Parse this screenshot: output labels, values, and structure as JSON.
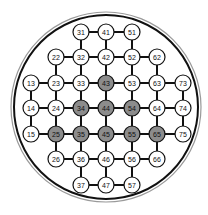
{
  "diagram": {
    "type": "grid-node-map",
    "colors": {
      "background": "#ffffff",
      "line": "#111111",
      "node_fill": "#ffffff",
      "node_highlight_fill": "#8c8c8c",
      "node_stroke": "#111111",
      "outer_ring_dark": "#111111",
      "outer_ring_light": "#9a9a9a"
    },
    "outer_circle": {
      "cx": 106,
      "cy": 107,
      "r_outer": 95,
      "r_inner": 92
    },
    "grid": {
      "columns_x": [
        31,
        56,
        81,
        106,
        132,
        157,
        183
      ],
      "rows_y": [
        32,
        57,
        83,
        108,
        134,
        159,
        185
      ],
      "node_radius": 8
    },
    "nodes": [
      {
        "label": "13",
        "col": 1,
        "row": 3,
        "highlighted": false
      },
      {
        "label": "14",
        "col": 1,
        "row": 4,
        "highlighted": false
      },
      {
        "label": "15",
        "col": 1,
        "row": 5,
        "highlighted": false
      },
      {
        "label": "22",
        "col": 2,
        "row": 2,
        "highlighted": false
      },
      {
        "label": "23",
        "col": 2,
        "row": 3,
        "highlighted": false
      },
      {
        "label": "24",
        "col": 2,
        "row": 4,
        "highlighted": false
      },
      {
        "label": "25",
        "col": 2,
        "row": 5,
        "highlighted": true
      },
      {
        "label": "26",
        "col": 2,
        "row": 6,
        "highlighted": false
      },
      {
        "label": "31",
        "col": 3,
        "row": 1,
        "highlighted": false
      },
      {
        "label": "32",
        "col": 3,
        "row": 2,
        "highlighted": false
      },
      {
        "label": "33",
        "col": 3,
        "row": 3,
        "highlighted": false
      },
      {
        "label": "34",
        "col": 3,
        "row": 4,
        "highlighted": true
      },
      {
        "label": "35",
        "col": 3,
        "row": 5,
        "highlighted": true
      },
      {
        "label": "36",
        "col": 3,
        "row": 6,
        "highlighted": false
      },
      {
        "label": "37",
        "col": 3,
        "row": 7,
        "highlighted": false
      },
      {
        "label": "41",
        "col": 4,
        "row": 1,
        "highlighted": false
      },
      {
        "label": "42",
        "col": 4,
        "row": 2,
        "highlighted": false
      },
      {
        "label": "43",
        "col": 4,
        "row": 3,
        "highlighted": true
      },
      {
        "label": "44",
        "col": 4,
        "row": 4,
        "highlighted": true
      },
      {
        "label": "45",
        "col": 4,
        "row": 5,
        "highlighted": true
      },
      {
        "label": "46",
        "col": 4,
        "row": 6,
        "highlighted": false
      },
      {
        "label": "47",
        "col": 4,
        "row": 7,
        "highlighted": false
      },
      {
        "label": "51",
        "col": 5,
        "row": 1,
        "highlighted": false
      },
      {
        "label": "52",
        "col": 5,
        "row": 2,
        "highlighted": false
      },
      {
        "label": "53",
        "col": 5,
        "row": 3,
        "highlighted": false
      },
      {
        "label": "54",
        "col": 5,
        "row": 4,
        "highlighted": true
      },
      {
        "label": "55",
        "col": 5,
        "row": 5,
        "highlighted": true
      },
      {
        "label": "56",
        "col": 5,
        "row": 6,
        "highlighted": false
      },
      {
        "label": "57",
        "col": 5,
        "row": 7,
        "highlighted": false
      },
      {
        "label": "62",
        "col": 6,
        "row": 2,
        "highlighted": false
      },
      {
        "label": "63",
        "col": 6,
        "row": 3,
        "highlighted": false
      },
      {
        "label": "64",
        "col": 6,
        "row": 4,
        "highlighted": false
      },
      {
        "label": "65",
        "col": 6,
        "row": 5,
        "highlighted": true
      },
      {
        "label": "66",
        "col": 6,
        "row": 6,
        "highlighted": false
      },
      {
        "label": "73",
        "col": 7,
        "row": 3,
        "highlighted": false
      },
      {
        "label": "74",
        "col": 7,
        "row": 4,
        "highlighted": false
      },
      {
        "label": "75",
        "col": 7,
        "row": 5,
        "highlighted": false
      }
    ]
  }
}
